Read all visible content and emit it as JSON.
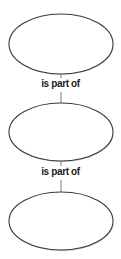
{
  "diagram": {
    "type": "entity-relationship-chain",
    "background_color": "#ffffff",
    "node_fill": "#ffffff",
    "node_stroke": "#3a3a3a",
    "shadow_color": "#b8b8b8",
    "connector_color": "#6e6e6e",
    "label_color": "#1c1c1c",
    "nodes": [
      {
        "id": "node-top",
        "shape": "ellipse",
        "label": "",
        "cx": 61,
        "cy": 44,
        "rx": 52,
        "ry": 30
      },
      {
        "id": "node-middle",
        "shape": "ellipse",
        "label": "",
        "cx": 61,
        "cy": 132,
        "rx": 52,
        "ry": 29
      },
      {
        "id": "node-bottom",
        "shape": "ellipse",
        "label": "",
        "cx": 61,
        "cy": 221,
        "rx": 52,
        "ry": 29
      }
    ],
    "edges": [
      {
        "id": "edge-top-middle",
        "label": "is part of",
        "from": "node-top",
        "to": "node-middle",
        "label_y": 80
      },
      {
        "id": "edge-middle-bottom",
        "label": "is part of",
        "from": "node-middle",
        "to": "node-bottom",
        "label_y": 168
      }
    ]
  }
}
